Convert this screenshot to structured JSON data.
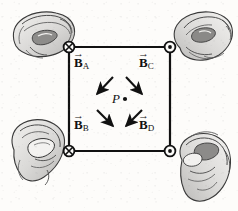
{
  "figure": {
    "background_color": "#fdfcfa",
    "ink_color": "#111111",
    "square": {
      "stroke": "#111111",
      "stroke_width": 2.2,
      "left": 69,
      "top": 47,
      "right": 170,
      "bottom": 151
    },
    "center_point": {
      "label": "P",
      "dot_symbol": "·",
      "x": 119,
      "y": 99
    },
    "corners": [
      {
        "id": "A",
        "position": "top-left",
        "symbol": "cross-in-circle",
        "symbol_name": "current-into-page",
        "x": 69,
        "y": 47
      },
      {
        "id": "C",
        "position": "top-right",
        "symbol": "dot-in-circle",
        "symbol_name": "current-out-of-page",
        "x": 170,
        "y": 47
      },
      {
        "id": "B",
        "position": "bottom-left",
        "symbol": "cross-in-circle",
        "symbol_name": "current-into-page",
        "x": 69,
        "y": 151
      },
      {
        "id": "D",
        "position": "bottom-right",
        "symbol": "dot-in-circle",
        "symbol_name": "current-out-of-page",
        "x": 170,
        "y": 151
      }
    ],
    "field_labels": [
      {
        "id": "BA",
        "base": "B",
        "subscript": "A",
        "arrow_accent": "→",
        "x": 76,
        "y": 62
      },
      {
        "id": "BC",
        "base": "B",
        "subscript": "C",
        "arrow_accent": "→",
        "x": 141,
        "y": 62
      },
      {
        "id": "BB",
        "base": "B",
        "subscript": "B",
        "arrow_accent": "→",
        "x": 76,
        "y": 124
      },
      {
        "id": "BD",
        "base": "B",
        "subscript": "D",
        "arrow_accent": "→",
        "x": 141,
        "y": 124
      }
    ],
    "field_vectors": [
      {
        "id": "BA-arrow",
        "from": [
          113,
          77
        ],
        "to": [
          96,
          95
        ],
        "direction": "down-left"
      },
      {
        "id": "BC-arrow",
        "from": [
          126,
          77
        ],
        "to": [
          143,
          95
        ],
        "direction": "down-right"
      },
      {
        "id": "BB-arrow",
        "from": [
          96,
          109
        ],
        "to": [
          114,
          127
        ],
        "direction": "down-right"
      },
      {
        "id": "BD-arrow",
        "from": [
          143,
          109
        ],
        "to": [
          125,
          127
        ],
        "direction": "up-left"
      }
    ],
    "hands": [
      {
        "id": "hand-top-left",
        "position": "top-left",
        "grip": "right-hand-grip",
        "x": 8,
        "y": 6
      },
      {
        "id": "hand-top-right",
        "position": "top-right",
        "grip": "right-hand-grip",
        "x": 172,
        "y": 6
      },
      {
        "id": "hand-bottom-left",
        "position": "bottom-left",
        "grip": "right-hand-grip",
        "x": 6,
        "y": 118
      },
      {
        "id": "hand-bottom-right",
        "position": "bottom-right",
        "grip": "right-hand-grip",
        "x": 170,
        "y": 130
      }
    ]
  }
}
